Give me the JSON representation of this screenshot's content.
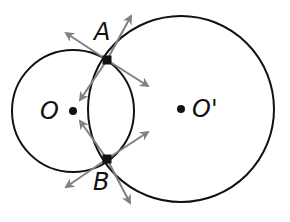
{
  "diagram": {
    "type": "two intersecting circles with tangent/radius vectors",
    "colors": {
      "stroke": "#111111",
      "arrow": "#808080",
      "background": "#ffffff"
    },
    "circles": [
      {
        "name": "small",
        "center_label": "O",
        "cx": 73,
        "cy": 111,
        "r": 61
      },
      {
        "name": "large",
        "center_label": "O'",
        "cx": 181,
        "cy": 109,
        "r": 93
      }
    ],
    "points": [
      {
        "label": "A",
        "x": 107,
        "y": 60
      },
      {
        "label": "B",
        "x": 107,
        "y": 159
      }
    ],
    "labels": {
      "A": "A",
      "B": "B",
      "O": "O",
      "O_prime": "O'"
    }
  }
}
